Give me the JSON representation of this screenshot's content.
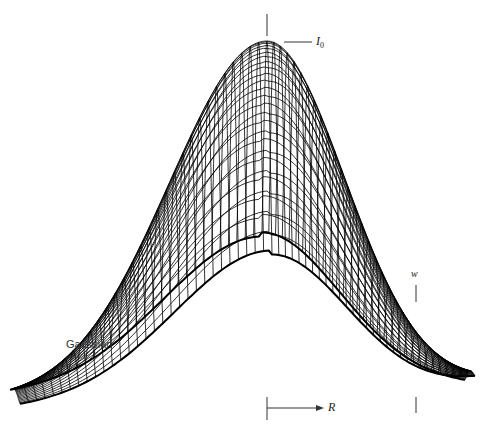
{
  "figure": {
    "type": "3d-wireframe-surface",
    "function": "gaussian",
    "labels": {
      "peak": "I",
      "peak_sub": "0",
      "width": "w",
      "radius": "R",
      "name": "Gaussian"
    },
    "caption": "",
    "colors": {
      "mesh": "#000000",
      "background": "#ffffff",
      "marker": "#333333"
    }
  }
}
